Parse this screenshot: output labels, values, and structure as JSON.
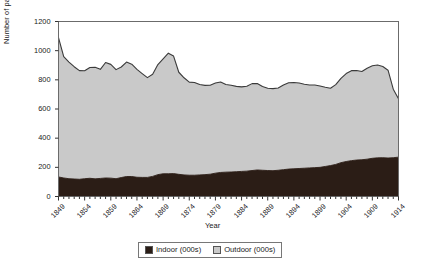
{
  "chart_data": {
    "type": "area",
    "title": "",
    "xlabel": "Year",
    "ylabel": "Number of paupers (1000s)",
    "stacked": true,
    "grid": false,
    "legend_position": "bottom",
    "xlim": [
      1849,
      1914
    ],
    "ylim": [
      0,
      1200
    ],
    "ytick_values": [
      0,
      200,
      400,
      600,
      800,
      1000,
      1200
    ],
    "ytick_labels": [
      "0",
      "200",
      "400",
      "600",
      "800",
      "1000",
      "1200"
    ],
    "xtick_labels": [
      "1849",
      "1854",
      "1859",
      "1864",
      "1869",
      "1874",
      "1879",
      "1884",
      "1889",
      "1894",
      "1899",
      "1904",
      "1909",
      "1914"
    ],
    "x": [
      1849,
      1850,
      1851,
      1852,
      1853,
      1854,
      1855,
      1856,
      1857,
      1858,
      1859,
      1860,
      1861,
      1862,
      1863,
      1864,
      1865,
      1866,
      1867,
      1868,
      1869,
      1870,
      1871,
      1872,
      1873,
      1874,
      1875,
      1876,
      1877,
      1878,
      1879,
      1880,
      1881,
      1882,
      1883,
      1884,
      1885,
      1886,
      1887,
      1888,
      1889,
      1890,
      1891,
      1892,
      1893,
      1894,
      1895,
      1896,
      1897,
      1898,
      1899,
      1900,
      1901,
      1902,
      1903,
      1904,
      1905,
      1906,
      1907,
      1908,
      1909,
      1910,
      1911,
      1912,
      1913,
      1914
    ],
    "series": [
      {
        "name": "Indoor (000s)",
        "color": "#2b1d16",
        "values": [
          134,
          127,
          122,
          120,
          118,
          122,
          125,
          121,
          124,
          127,
          126,
          122,
          130,
          137,
          137,
          132,
          131,
          131,
          138,
          150,
          156,
          156,
          157,
          152,
          148,
          146,
          146,
          148,
          150,
          153,
          160,
          165,
          167,
          168,
          170,
          172,
          174,
          178,
          182,
          180,
          178,
          177,
          180,
          184,
          188,
          190,
          192,
          194,
          196,
          198,
          200,
          206,
          212,
          220,
          232,
          240,
          246,
          250,
          252,
          256,
          262,
          265,
          266,
          264,
          266,
          270
        ]
      },
      {
        "name": "Outdoor (000s)",
        "color": "#c9c9c9",
        "values": [
          955,
          832,
          800,
          770,
          745,
          740,
          760,
          765,
          748,
          792,
          780,
          748,
          758,
          785,
          770,
          740,
          712,
          684,
          700,
          755,
          788,
          827,
          806,
          700,
          666,
          638,
          636,
          620,
          612,
          610,
          618,
          620,
          601,
          595,
          585,
          580,
          582,
          596,
          593,
          574,
          564,
          563,
          564,
          580,
          592,
          592,
          586,
          576,
          569,
          567,
          558,
          543,
          530,
          547,
          578,
          603,
          617,
          614,
          605,
          624,
          634,
          637,
          625,
          602,
          470,
          400
        ]
      }
    ],
    "totals": [
      1089,
      959,
      922,
      890,
      863,
      862,
      885,
      886,
      872,
      919,
      906,
      870,
      888,
      922,
      907,
      872,
      843,
      815,
      838,
      905,
      944,
      983,
      963,
      852,
      814,
      784,
      782,
      768,
      762,
      763,
      778,
      785,
      768,
      763,
      755,
      752,
      756,
      774,
      775,
      754,
      742,
      740,
      744,
      764,
      780,
      782,
      778,
      770,
      765,
      765,
      758,
      749,
      742,
      767,
      810,
      843,
      863,
      864,
      857,
      880,
      896,
      902,
      891,
      866,
      736,
      670
    ]
  },
  "legend": {
    "items": [
      {
        "label": "Indoor (000s)",
        "color": "#2b1d16"
      },
      {
        "label": "Outdoor (000s)",
        "color": "#c9c9c9"
      }
    ]
  },
  "axes": {
    "y_title": "Number of paupers (1000s)",
    "x_title": "Year"
  },
  "style": {
    "plot_border": "#6b6b6b",
    "line_color": "#3a3a3a",
    "background": "#ffffff"
  }
}
